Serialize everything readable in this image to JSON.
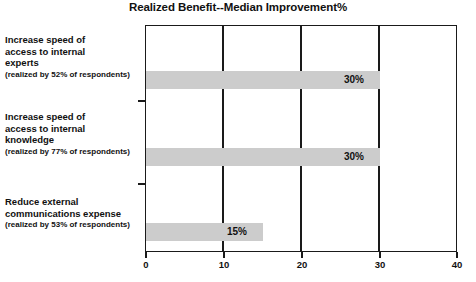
{
  "chart_data": {
    "type": "bar",
    "orientation": "horizontal",
    "title": "Realized Benefit--Median Improvement%",
    "xlabel": "",
    "ylabel": "",
    "xlim": [
      0,
      40
    ],
    "xticks": [
      "0",
      "10",
      "20",
      "30",
      "40"
    ],
    "grid": "vertical-at-xticks",
    "legend": "none",
    "bar_color": "#cccccc",
    "axis_color": "#1a1a1a",
    "categories": [
      {
        "lines": [
          "Increase speed of",
          "access to internal",
          "experts"
        ],
        "sub": "(realized by 52% of respondents)",
        "value": 30,
        "value_label": "30%"
      },
      {
        "lines": [
          "Increase speed of",
          "access to internal",
          "knowledge"
        ],
        "sub": "(realized by 77% of respondents)",
        "value": 30,
        "value_label": "30%"
      },
      {
        "lines": [
          "Reduce external",
          "communications expense"
        ],
        "sub": "(realized by 53% of respondents)",
        "value": 15,
        "value_label": "15%"
      }
    ],
    "values": [
      30,
      30,
      15
    ]
  }
}
